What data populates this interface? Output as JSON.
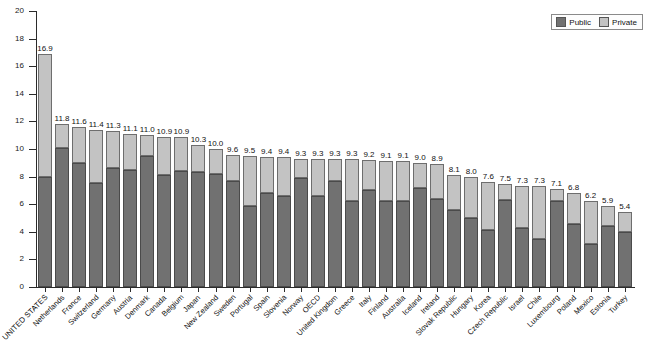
{
  "chart_data": {
    "type": "bar",
    "subtype": "stacked",
    "title": "",
    "xlabel": "",
    "ylabel": "Percent GDP",
    "ylim": [
      0,
      20
    ],
    "yticks": [
      0,
      2,
      4,
      6,
      8,
      10,
      12,
      14,
      16,
      18,
      20
    ],
    "grid": false,
    "legend_position": "top-right",
    "legend": [
      "Public",
      "Private"
    ],
    "categories": [
      "UNITED STATES",
      "Netherlands",
      "France",
      "Switzerland",
      "Germany",
      "Austria",
      "Denmark",
      "Canada",
      "Belgium",
      "Japan",
      "New Zealand",
      "Sweden",
      "Portugal",
      "Spain",
      "Slovenia",
      "Norway",
      "OECD",
      "United Kingdom",
      "Greece",
      "Italy",
      "Finland",
      "Australia",
      "Iceland",
      "Ireland",
      "Slovak Republic",
      "Hungary",
      "Korea",
      "Czech Republic",
      "Israel",
      "Chile",
      "Luxembourg",
      "Poland",
      "Mexico",
      "Estonia",
      "Turkey"
    ],
    "series": [
      {
        "name": "Public",
        "color": "#717171",
        "values": [
          8.0,
          10.1,
          9.0,
          7.5,
          8.6,
          8.5,
          9.5,
          8.1,
          8.4,
          8.3,
          8.2,
          7.7,
          5.9,
          6.8,
          6.6,
          7.9,
          6.6,
          7.7,
          6.2,
          7.0,
          6.2,
          6.2,
          7.2,
          6.4,
          5.6,
          5.0,
          4.1,
          6.3,
          4.3,
          3.5,
          6.2,
          4.6,
          3.1,
          4.4,
          4.0
        ]
      },
      {
        "name": "Private",
        "color": "#c3c3c3",
        "values": [
          8.9,
          1.7,
          2.6,
          3.9,
          2.7,
          2.6,
          1.5,
          2.8,
          2.5,
          2.6,
          2.1,
          2.3,
          3.7,
          2.6,
          2.8,
          1.5,
          2.7,
          1.6,
          3.1,
          2.2,
          2.9,
          2.8,
          1.8,
          2.5,
          2.5,
          3.0,
          3.5,
          1.2,
          3.0,
          3.8,
          0.9,
          2.2,
          3.1,
          1.5,
          1.4
        ]
      }
    ],
    "totals": [
      16.9,
      11.8,
      11.6,
      11.4,
      11.3,
      11.1,
      11.0,
      10.9,
      10.9,
      10.3,
      10.0,
      9.6,
      9.5,
      9.4,
      9.4,
      9.3,
      9.3,
      9.3,
      9.3,
      9.2,
      9.1,
      9.1,
      9.0,
      8.9,
      8.1,
      8.0,
      7.6,
      7.5,
      7.3,
      7.3,
      7.1,
      6.8,
      6.2,
      5.9,
      5.4
    ]
  }
}
